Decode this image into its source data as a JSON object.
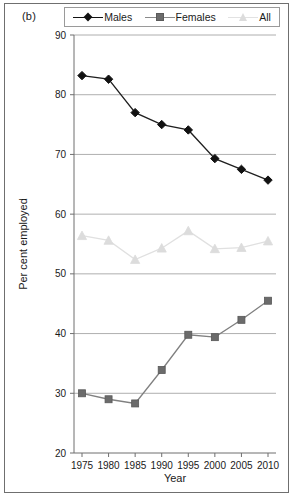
{
  "figure": {
    "panel_label": "(b)",
    "border_color": "#6f6f6f",
    "background": "#ffffff"
  },
  "legend": {
    "position": "top-center",
    "entries": [
      {
        "label": "Males",
        "marker": "diamond-marker",
        "color": "#121212"
      },
      {
        "label": "Females",
        "marker": "square-marker",
        "color": "#6b6b6b"
      },
      {
        "label": "All",
        "marker": "triangle-marker",
        "color": "#dcdcdc"
      }
    ]
  },
  "chart_data": {
    "type": "line",
    "title": "(b)",
    "xlabel": "Year",
    "ylabel": "Per cent employed",
    "x": [
      1975,
      1980,
      1985,
      1990,
      1995,
      2000,
      2005,
      2010
    ],
    "categories": [
      "1975",
      "1980",
      "1985",
      "1990",
      "1995",
      "2000",
      "2005",
      "2010"
    ],
    "xlim": [
      1972.5,
      2012.5
    ],
    "ylim": [
      20,
      90
    ],
    "xticks": [
      "1975",
      "1980",
      "1985",
      "1990",
      "1995",
      "2000",
      "2005",
      "2010"
    ],
    "yticks": [
      "20",
      "30",
      "40",
      "50",
      "60",
      "70",
      "80",
      "90"
    ],
    "grid": "horizontal-major",
    "legend_position": "top-center",
    "series": [
      {
        "name": "Males",
        "marker": "diamond-marker",
        "color": "#121212",
        "values": [
          83.2,
          82.6,
          77.0,
          75.0,
          74.1,
          69.3,
          67.5,
          65.7
        ]
      },
      {
        "name": "Females",
        "marker": "square-marker",
        "color": "#6b6b6b",
        "values": [
          30.0,
          29.0,
          28.3,
          33.9,
          39.8,
          39.4,
          42.3,
          45.5
        ]
      },
      {
        "name": "All",
        "marker": "triangle-marker",
        "color": "#dcdcdc",
        "values": [
          56.4,
          55.6,
          52.4,
          54.3,
          57.2,
          54.2,
          54.4,
          55.5
        ]
      }
    ]
  }
}
